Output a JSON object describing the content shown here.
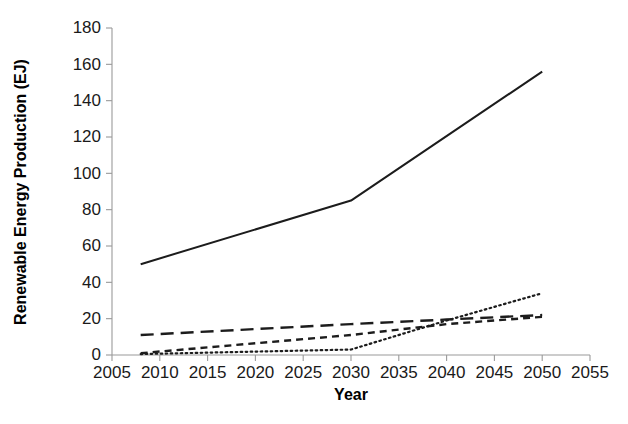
{
  "chart_data": {
    "type": "line",
    "title": "",
    "subtitle": "",
    "xlabel": "Year",
    "ylabel": "Renewable Energy Production (EJ)",
    "xlim": [
      2005,
      2055
    ],
    "ylim": [
      0,
      180
    ],
    "xticks": [
      2005,
      2010,
      2015,
      2020,
      2025,
      2030,
      2035,
      2040,
      2045,
      2050,
      2055
    ],
    "yticks": [
      0,
      20,
      40,
      60,
      80,
      100,
      120,
      140,
      160,
      180
    ],
    "xtick_labels": [
      "2005",
      "2010",
      "2015",
      "2020",
      "2025",
      "2030",
      "2035",
      "2040",
      "2045",
      "2050",
      "2055"
    ],
    "ytick_labels": [
      "0",
      "20",
      "40",
      "60",
      "80",
      "100",
      "120",
      "140",
      "160",
      "180"
    ],
    "grid": false,
    "legend": "none",
    "x": [
      2008,
      2030,
      2050
    ],
    "series": [
      {
        "name": "series-solid",
        "style": "solid",
        "color": "#1c1c1c",
        "x": [
          2008,
          2030,
          2050
        ],
        "values": [
          50,
          85,
          156
        ]
      },
      {
        "name": "series-long-dash",
        "style": "long-dash",
        "color": "#1c1c1c",
        "x": [
          2008,
          2030,
          2040,
          2050
        ],
        "values": [
          11,
          17,
          19.5,
          22
        ]
      },
      {
        "name": "series-short-dash",
        "style": "short-dash",
        "color": "#1c1c1c",
        "x": [
          2008,
          2030,
          2040,
          2050
        ],
        "values": [
          1,
          11,
          17,
          21
        ]
      },
      {
        "name": "series-dotted",
        "style": "dotted",
        "color": "#1c1c1c",
        "x": [
          2008,
          2030,
          2040,
          2050
        ],
        "values": [
          0.5,
          3,
          19,
          34
        ]
      }
    ]
  }
}
